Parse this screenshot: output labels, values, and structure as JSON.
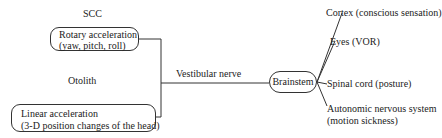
{
  "diagram": {
    "scc": {
      "label": "SCC",
      "line1": "Rotary acceleration",
      "line2": "(yaw, pitch, roll)"
    },
    "otolith": {
      "label": "Otolith",
      "line1": "Linear acceleration",
      "line2": "(3-D position changes of the head)"
    },
    "nerve_label": "Vestibular nerve",
    "hub": "Brainstem",
    "outputs": [
      {
        "line1": "Cortex (conscious sensation)"
      },
      {
        "line1": "Eyes (VOR)"
      },
      {
        "line1": "Spinal cord (posture)"
      },
      {
        "line1": "Autonomic nervous system",
        "line2": "(motion sickness)"
      }
    ]
  }
}
